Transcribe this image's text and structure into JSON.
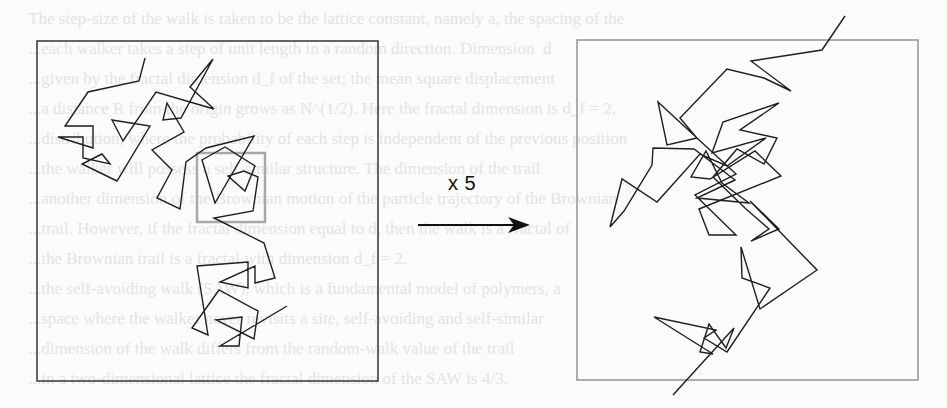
{
  "figure": {
    "scale_label": "x 5",
    "colors": {
      "background": "#fbfbfa",
      "left_frame": "#333333",
      "right_frame": "#9a9a9a",
      "zoom_box": "#a8a8a8",
      "path": "#1e1e1e",
      "arrow": "#111111",
      "bleed_text": "#e4e4e2"
    },
    "left_panel": {
      "frame": {
        "x": 37,
        "y": 41,
        "w": 341,
        "h": 340
      },
      "zoom_box": {
        "x": 197,
        "y": 153,
        "w": 68,
        "h": 69
      },
      "path": "145,58 139,81 88,92 65,126 93,126 93,148 58,137 83,137 83,158 110,164 102,154 82,164 117,181 150,126 112,120 123,141 156,92 214,109 190,87 213,59 181,118 163,120 167,103 184,132 152,150 172,170 157,198 180,209 186,162 206,148 254,136 215,203 202,160 225,147 255,166 245,191 228,176 244,171 258,177 253,211 214,218 264,243 275,278 255,283 255,266 220,282 248,288 248,262 197,266 208,335 192,328 219,290 258,311 254,339 216,320 242,317 239,346 220,346 287,306"
    },
    "right_panel": {
      "frame": {
        "x": 577,
        "y": 40,
        "w": 341,
        "h": 340
      },
      "path": "845,16 822,50 751,61 791,91 764,78 727,69 680,118 697,138 667,145 658,102 736,174 695,195 736,235 709,235 699,209 781,176 755,151 710,179 691,177 706,151 722,183 749,203 697,198 735,180 694,149 653,148 652,165 624,211 610,227 622,179 657,202 700,154 727,166 766,138 712,153 723,122 779,103 740,130 777,138 764,164 737,149 713,177 746,209 769,229 751,241 779,229 750,201 817,270 760,309 741,247 742,278 770,288 727,352 704,338 716,330 654,317 713,354 700,352 709,324 726,348 734,328 673,395"
    },
    "arrow": {
      "x1": 418,
      "y1": 225,
      "x2": 530,
      "y2": 225
    },
    "bleed_lines": [
      "  The step-size of the walk is taken to be the lattice constant, namely a, the spacing of the",
      "  ...each walker takes a step of unit length in a random direction. Dimension  d",
      "  ...given by the fractal dimension d_f of the set; the mean square displacement",
      "  ...a distance R from the origin grows as N^(1/2). Here the fractal dimension is d_f = 2,",
      "  ...distribution, where the probability of each step is independent of the previous position",
      "  ...the walker will possess a self-similar structure. The dimension of the trail",
      "  ...another dimension of the Brownian motion of the particle trajectory of the Brownian",
      "  ...trail. However, if the fractal dimension equal to d, then the walk is a fractal of",
      "  ...the Brownian trail is a fractal with dimension d_f = 2.",
      "  ...the self-avoiding walk (SAW), which is a fundamental model of polymers, a",
      "  ...space where the walker never revisits a site, self-avoiding and self-similar",
      "  ...dimension of the walk differs from the random-walk value of the trail",
      "  ...in a two-dimensional lattice the fractal dimension of the SAW is 4/3."
    ]
  }
}
